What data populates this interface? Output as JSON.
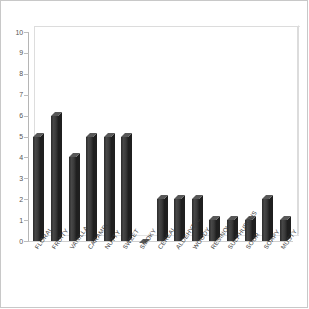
{
  "chart_data": {
    "type": "bar",
    "title": "",
    "subtitle": "",
    "xlabel": "",
    "ylabel": "",
    "ylim": [
      0,
      10
    ],
    "yticks": [
      "0",
      "1",
      "2",
      "3",
      "4",
      "5",
      "6",
      "7",
      "8",
      "9",
      "10"
    ],
    "grid": false,
    "legend": "none",
    "style": "3d-bar",
    "bar_color": "#3d3d3d",
    "background_color": "#ffffff",
    "axis_color": "#bdbdbd",
    "categories": [
      "FLORAL",
      "FRUITY",
      "VANILLA",
      "CARAMEL",
      "NUTTY",
      "SWEET",
      "SMOKY",
      "CEREAL",
      "ALDEHYDIC",
      "WOODY",
      "RESINOUS",
      "SULPHUROUS",
      "SOUR",
      "SOAPY",
      "MUSTY"
    ],
    "values": [
      5,
      6,
      4,
      5,
      5,
      5,
      0,
      2,
      2,
      2,
      1,
      1,
      1,
      2,
      1
    ]
  }
}
